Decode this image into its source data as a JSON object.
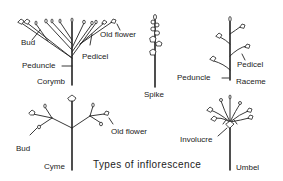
{
  "title": "Types of inflorescence",
  "diagrams": [
    {
      "name": "Corymb",
      "labels": [
        "Bud",
        "Old flower",
        "Pedicel",
        "Peduncle",
        "Corymb"
      ]
    },
    {
      "name": "Spike",
      "labels": [
        "Spike"
      ]
    },
    {
      "name": "Raceme",
      "labels": [
        "Pedicel",
        "Peduncle",
        "Raceme"
      ]
    },
    {
      "name": "Cyme",
      "labels": [
        "Bud",
        "Old flower",
        "Cyme"
      ]
    },
    {
      "name": "Umbel",
      "labels": [
        "Involucre",
        "Umbel"
      ]
    }
  ],
  "labels": {
    "corymb_bud": "Bud",
    "corymb_old_flower": "Old flower",
    "corymb_pedicel": "Pedicel",
    "corymb_peduncle": "Peduncle",
    "corymb_name": "Corymb",
    "spike_name": "Spike",
    "raceme_pedicel": "Pedicel",
    "raceme_peduncle": "Peduncle",
    "raceme_name": "Raceme",
    "cyme_bud": "Bud",
    "cyme_old_flower": "Old flower",
    "cyme_name": "Cyme",
    "umbel_involucre": "Involucre",
    "umbel_name": "Umbel"
  }
}
